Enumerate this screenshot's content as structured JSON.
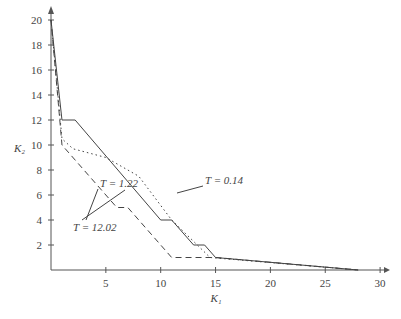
{
  "chart_data": {
    "type": "line",
    "title": "",
    "xlabel": "K1",
    "ylabel": "K2",
    "xlim": [
      0,
      30
    ],
    "ylim": [
      0,
      20
    ],
    "xticks": [
      5,
      10,
      15,
      20,
      25,
      30
    ],
    "yticks": [
      2,
      4,
      6,
      8,
      10,
      12,
      14,
      16,
      18,
      20
    ],
    "grid": false,
    "series": [
      {
        "name": "T = 1.22",
        "style": "solid",
        "x": [
          0,
          1,
          2.2,
          10,
          11,
          13,
          14,
          15,
          28
        ],
        "y": [
          20,
          12,
          12,
          4,
          4,
          2,
          2,
          1,
          0
        ]
      },
      {
        "name": "T = 0.14",
        "style": "dotted",
        "x": [
          0,
          1,
          2,
          5,
          8,
          11,
          14.5,
          28
        ],
        "y": [
          20,
          10.5,
          9.7,
          9,
          7.5,
          4,
          1,
          0
        ]
      },
      {
        "name": "T = 12.02",
        "style": "dashed",
        "x": [
          0,
          1,
          6,
          7,
          11,
          15,
          28
        ],
        "y": [
          20,
          10,
          5,
          5,
          1,
          1,
          0
        ]
      }
    ],
    "annotations": [
      {
        "text": "T = 1.22",
        "x": 7.5,
        "y": 13.5
      },
      {
        "text": "T = 0.14",
        "x": 12.5,
        "y": 7.5
      },
      {
        "text": "T = 12.02",
        "x": 3,
        "y": 3.5
      }
    ]
  }
}
